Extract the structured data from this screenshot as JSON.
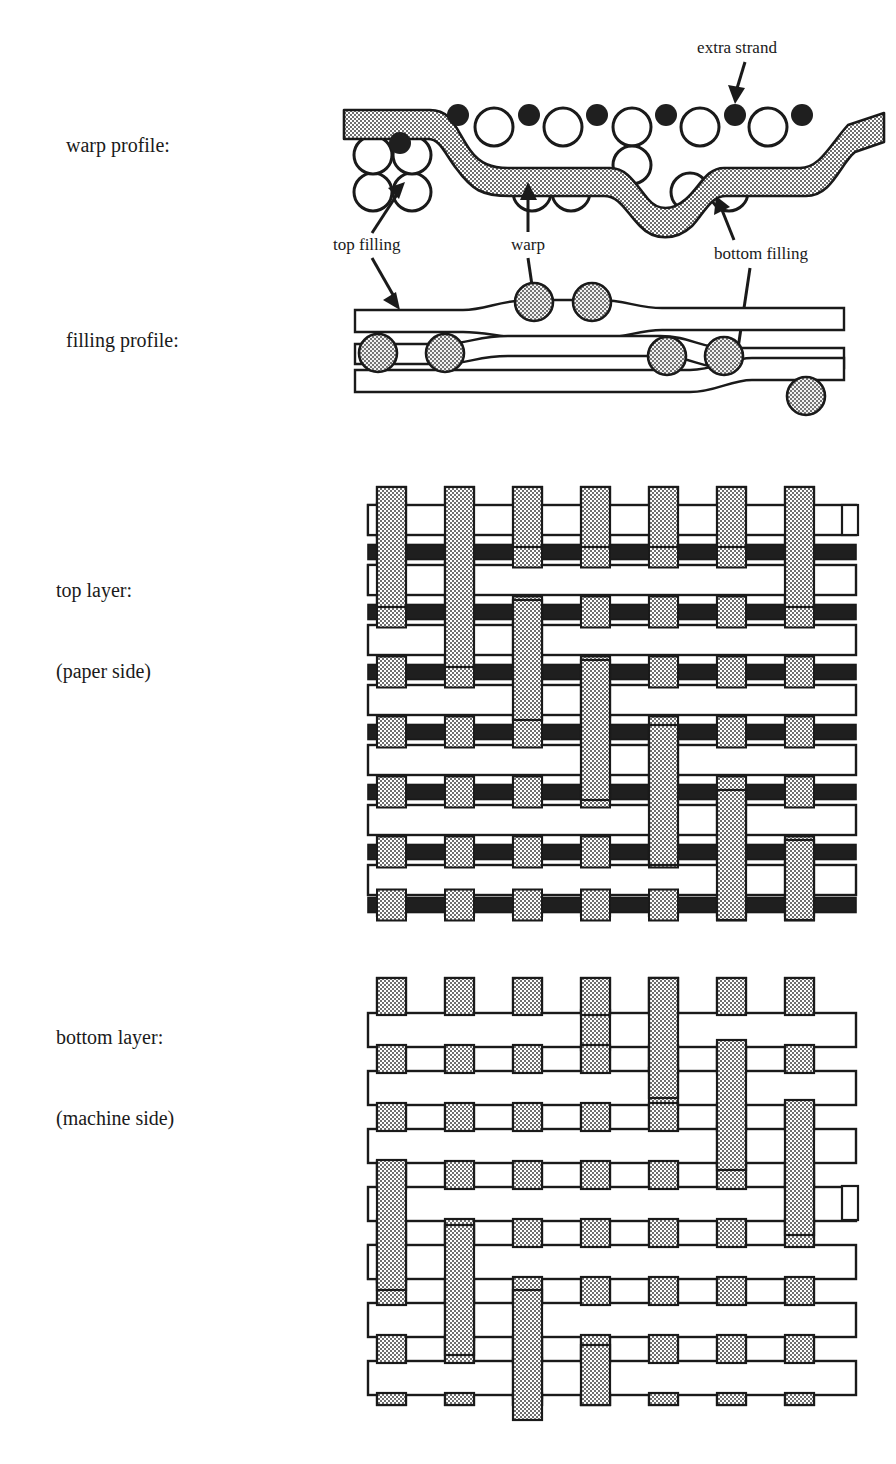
{
  "figure": {
    "colors": {
      "warp_fill": "#9a9a9a",
      "extra_strand": "#1a1a1a",
      "outline": "#1a1a1a",
      "filling_fill": "#ffffff",
      "background": "#ffffff"
    }
  },
  "row_labels": [
    {
      "id": "warp-profile",
      "line1": "warp profile:",
      "line2": ""
    },
    {
      "id": "filling-profile",
      "line1": "filling profile:",
      "line2": ""
    },
    {
      "id": "top-layer",
      "line1": "top layer:",
      "line2": "(paper side)"
    },
    {
      "id": "bottom-layer",
      "line1": "bottom layer:",
      "line2": "(machine side)"
    }
  ],
  "callouts": [
    {
      "id": "extra-strand",
      "text": "extra strand",
      "x": 737,
      "y": 47
    },
    {
      "id": "top-filling",
      "text": "top filling",
      "x": 333,
      "y": 243
    },
    {
      "id": "warp",
      "text": "warp",
      "x": 511,
      "y": 243
    },
    {
      "id": "bottom-filling",
      "text": "bottom filling",
      "x": 714,
      "y": 252
    }
  ],
  "chart_data": {
    "type": "diagram",
    "panels": [
      {
        "name": "warp profile",
        "description": "Cross-section along a warp yarn showing top filling circles (open), bottom filling circles (open), small filled extra-strand dots and a shaded serpentine warp yarn.",
        "top_filling_count": 14,
        "bottom_filling_count": 12,
        "extra_strand_dot_count": 7
      },
      {
        "name": "filling profile",
        "description": "Cross-section along a filling yarn showing three white ribbon paths and shaded warp circles above, between and below.",
        "warp_circle_count": 7,
        "ribbon_count": 3
      },
      {
        "name": "top layer (paper side)",
        "description": "Plan view weave. 7 shaded warp columns; white filling picks alternating with narrow black extra-strand picks.",
        "warp_columns": 7,
        "filling_rows": 7,
        "extra_strand_rows": 7
      },
      {
        "name": "bottom layer (machine side)",
        "description": "Plan view weave. 7 shaded warp columns and 7 white filling picks in a broken twill.",
        "warp_columns": 7,
        "filling_rows": 7
      }
    ]
  }
}
